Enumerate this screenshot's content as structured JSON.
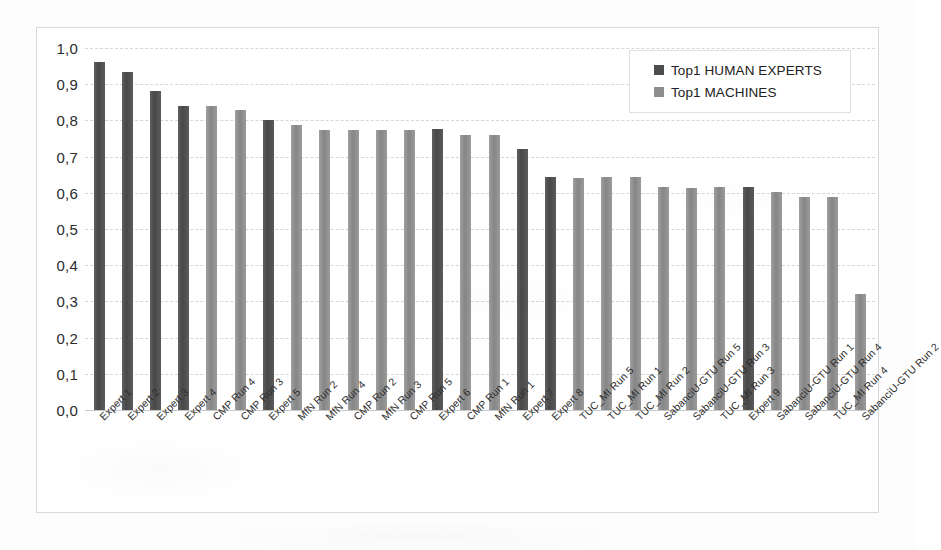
{
  "chart_data": {
    "type": "bar",
    "title": "",
    "xlabel": "",
    "ylabel": "",
    "ylim": [
      0.0,
      1.0
    ],
    "grid": true,
    "legend_position": "top-right",
    "y_tick_labels": [
      "1,0",
      "0,9",
      "0,8",
      "0,7",
      "0,6",
      "0,5",
      "0,4",
      "0,3",
      "0,2",
      "0,1",
      "0,0"
    ],
    "y_tick_values": [
      1.0,
      0.9,
      0.8,
      0.7,
      0.6,
      0.5,
      0.4,
      0.3,
      0.2,
      0.1,
      0.0
    ],
    "legend": [
      {
        "name": "Top1 HUMAN EXPERTS",
        "color": "#4d4d4d",
        "series": "human"
      },
      {
        "name": "Top1 MACHINES",
        "color": "#8d8d8d",
        "series": "machine"
      }
    ],
    "categories": [
      "Expert 1",
      "Expert 2",
      "Expert 3",
      "Expert 4",
      "CMP Run 4",
      "CMP Run 3",
      "Expert 5",
      "MfN Run 2",
      "MfN Run 4",
      "CMP Run 2",
      "MfN Run 3",
      "CMP Run 5",
      "Expert 6",
      "CMP Run 1",
      "MfN Run 1",
      "Expert 7",
      "Expert 8",
      "TUC_MI Run 5",
      "TUC_MI Run 1",
      "TUC_MI Run 2",
      "SabanciU-GTU Run 5",
      "SabanciU-GTU Run 3",
      "TUC_MI Run 3",
      "Expert 9",
      "SabanciU-GTU Run 1",
      "SabanciU-GTU Run 4",
      "TUC_MI Run 4",
      "SabanciU-GTU Run 2"
    ],
    "values": [
      0.96,
      0.935,
      0.88,
      0.84,
      0.84,
      0.828,
      0.8,
      0.787,
      0.773,
      0.773,
      0.773,
      0.773,
      0.775,
      0.76,
      0.76,
      0.72,
      0.645,
      0.642,
      0.645,
      0.643,
      0.615,
      0.613,
      0.617,
      0.615,
      0.602,
      0.589,
      0.589,
      0.32
    ],
    "series_of_bar": [
      "human",
      "human",
      "human",
      "human",
      "machine",
      "machine",
      "human",
      "machine",
      "machine",
      "machine",
      "machine",
      "machine",
      "human",
      "machine",
      "machine",
      "human",
      "human",
      "machine",
      "machine",
      "machine",
      "machine",
      "machine",
      "machine",
      "human",
      "machine",
      "machine",
      "machine",
      "machine"
    ],
    "colors": {
      "human": "#4d4d4d",
      "machine": "#8d8d8d",
      "gridline": "#d6d6d6",
      "frame": "#d8d8d8",
      "background": "#ffffff"
    }
  }
}
